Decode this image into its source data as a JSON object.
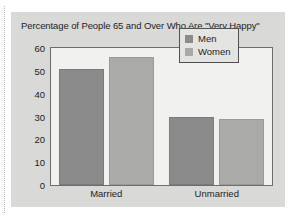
{
  "chart_data": {
    "type": "bar",
    "title": "Percentage of People 65 and Over Who Are \"Very Happy\"",
    "xlabel": "",
    "ylabel": "",
    "categories": [
      "Married",
      "Unmarried"
    ],
    "series": [
      {
        "name": "Men",
        "values": [
          51,
          30
        ],
        "color": "#8b8b8b"
      },
      {
        "name": "Women",
        "values": [
          56,
          29
        ],
        "color": "#aaaaa8"
      }
    ],
    "ylim": [
      0,
      60
    ],
    "yticks": [
      0,
      10,
      20,
      30,
      40,
      50,
      60
    ],
    "ytick_labels": [
      "0",
      "10",
      "20",
      "30",
      "40",
      "50",
      "60"
    ],
    "grid": false,
    "legend_position": "top-right",
    "legend_entries": [
      "Men",
      "Women"
    ]
  },
  "figure": {
    "background_color": "#d9d9d7",
    "plot_background_color": "#f1f1ef",
    "frame_color": "#6d6d6d"
  }
}
